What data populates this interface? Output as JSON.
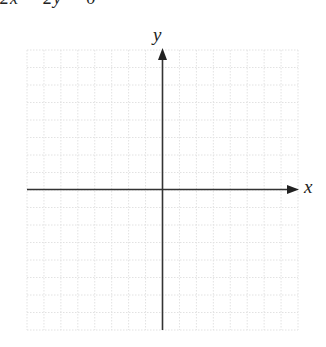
{
  "header": {
    "cut_off_text": "2x − 2y = 6"
  },
  "chart_data": {
    "type": "scatter",
    "title": "",
    "xlabel": "x",
    "ylabel": "y",
    "grid": true,
    "grid_columns": 16,
    "grid_rows": 16,
    "xlim": [
      -8,
      8
    ],
    "ylim": [
      -8,
      8
    ],
    "x": [],
    "y": [],
    "note": "Blank coordinate grid with x and y axes, no data points plotted"
  },
  "axes": {
    "x_label": "x",
    "y_label": "y"
  },
  "colors": {
    "grid": "#e4e4e4",
    "axis": "#333333"
  }
}
